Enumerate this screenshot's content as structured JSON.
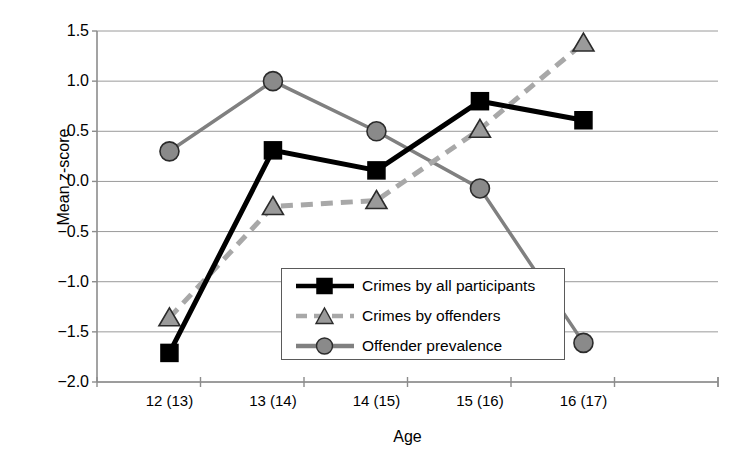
{
  "chart_data": {
    "type": "line",
    "title": "",
    "xlabel": "Age",
    "ylabel": "Mean z-score",
    "categories": [
      "12 (13)",
      "13 (14)",
      "14 (15)",
      "15 (16)",
      "16 (17)"
    ],
    "ylim": [
      -2.0,
      1.5
    ],
    "yticks": [
      1.5,
      1.0,
      0.5,
      0.0,
      -0.5,
      -1.0,
      -1.5,
      -2.0
    ],
    "ytick_labels": [
      "1.5",
      "1.0",
      "0.5",
      "0.0",
      "-0.5",
      "-1.0",
      "-1.5",
      "-2.0"
    ],
    "grid": true,
    "legend_position": "center-bottom-inside",
    "series": [
      {
        "name": "Crimes by all participants",
        "values": [
          -1.71,
          0.31,
          0.11,
          0.8,
          0.61
        ],
        "color": "#000000",
        "marker": "square",
        "linestyle": "solid"
      },
      {
        "name": "Crimes by offenders",
        "values": [
          -1.36,
          -0.25,
          -0.19,
          0.52,
          1.38
        ],
        "color": "#a8a8a8",
        "marker": "triangle",
        "linestyle": "dashed"
      },
      {
        "name": "Offender prevalence",
        "values": [
          0.3,
          1.0,
          0.5,
          -0.07,
          -1.61
        ],
        "color": "#808080",
        "marker": "circle",
        "linestyle": "solid"
      }
    ]
  },
  "legend": {
    "items": [
      {
        "label": "Crimes by all participants"
      },
      {
        "label": "Crimes by offenders"
      },
      {
        "label": "Offender prevalence"
      }
    ]
  },
  "colors": {
    "axis": "#8c8c8c",
    "grid": "#9a9a9a",
    "series_black": "#000000",
    "series_gray_dashed": "#a8a8a8",
    "series_gray_solid": "#808080",
    "legend_border": "#5a5a5a"
  }
}
